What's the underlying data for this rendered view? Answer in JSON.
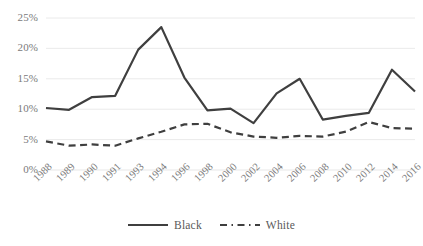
{
  "chart_data": {
    "type": "line",
    "title": "",
    "subtitle": "",
    "xlabel": "",
    "ylabel": "",
    "ylim": [
      0,
      25
    ],
    "ytick_values": [
      0,
      5,
      10,
      15,
      20,
      25
    ],
    "ytick_labels": [
      "0%",
      "5%",
      "10%",
      "15%",
      "20%",
      "25%"
    ],
    "grid": "horizontal",
    "legend_position": "bottom-center",
    "categories": [
      "1988",
      "1989",
      "1990",
      "1991",
      "1993",
      "1994",
      "1996",
      "1998",
      "2000",
      "2002",
      "2004",
      "2006",
      "2008",
      "2010",
      "2012",
      "2014",
      "2016"
    ],
    "series": [
      {
        "name": "Black",
        "style": "solid",
        "color": "#3f3f3f",
        "values": [
          10.2,
          9.9,
          12.0,
          12.2,
          19.8,
          23.5,
          15.2,
          9.8,
          10.1,
          7.7,
          12.6,
          15.0,
          8.3,
          8.9,
          9.4,
          16.5,
          12.9
        ]
      },
      {
        "name": "White",
        "style": "dashed",
        "color": "#3f3f3f",
        "values": [
          4.7,
          4.0,
          4.2,
          4.0,
          5.2,
          6.3,
          7.5,
          7.6,
          6.2,
          5.5,
          5.3,
          5.6,
          5.5,
          6.3,
          7.9,
          6.9,
          6.8
        ]
      }
    ]
  },
  "legend": {
    "entries": [
      {
        "label": "Black",
        "icon": "solid-line-swatch"
      },
      {
        "label": "White",
        "icon": "dashed-line-swatch"
      }
    ]
  },
  "colors": {
    "series_line": "#3f3f3f",
    "gridline": "#e8e8e8",
    "tick_text": "#7a7a7a",
    "legend_text": "#595959",
    "background": "#ffffff"
  }
}
